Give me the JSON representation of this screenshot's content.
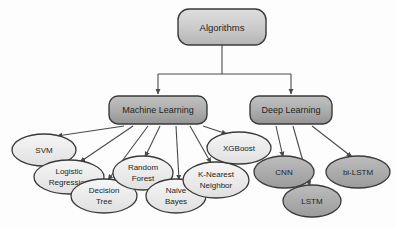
{
  "diagram": {
    "root": {
      "id": "algorithms",
      "label": "Algorithms",
      "shape": "rounded-rect",
      "fill": "#c9c9c9",
      "x": 222,
      "y": 27,
      "w": 88,
      "h": 36
    },
    "branches": [
      {
        "id": "machine-learning",
        "label": "Machine Learning",
        "shape": "rounded-rect",
        "fill": "#a9a9a9",
        "x": 158,
        "y": 110,
        "w": 98,
        "h": 28
      },
      {
        "id": "deep-learning",
        "label": "Deep Learning",
        "shape": "rounded-rect",
        "fill": "#a9a9a9",
        "x": 291,
        "y": 110,
        "w": 82,
        "h": 28
      }
    ],
    "leaves": [
      {
        "id": "svm",
        "parent": "machine-learning",
        "lines": [
          "SVM"
        ],
        "fill": "#ececec",
        "x": 44,
        "y": 150,
        "rx": 32,
        "ry": 16
      },
      {
        "id": "logistic-regression",
        "parent": "machine-learning",
        "lines": [
          "Logistic",
          "Regression"
        ],
        "fill": "#ececec",
        "x": 69,
        "y": 177,
        "rx": 35,
        "ry": 17
      },
      {
        "id": "decision-tree",
        "parent": "machine-learning",
        "lines": [
          "Decision",
          "Tree"
        ],
        "fill": "#ececec",
        "x": 104,
        "y": 196,
        "rx": 33,
        "ry": 17
      },
      {
        "id": "random-forest",
        "parent": "machine-learning",
        "lines": [
          "Random",
          "Forest"
        ],
        "fill": "#ececec",
        "x": 143,
        "y": 173,
        "rx": 30,
        "ry": 17
      },
      {
        "id": "naive-bayes",
        "parent": "machine-learning",
        "lines": [
          "Naive",
          "Bayes"
        ],
        "fill": "#ececec",
        "x": 176,
        "y": 196,
        "rx": 30,
        "ry": 17
      },
      {
        "id": "k-nearest-neighbor",
        "parent": "machine-learning",
        "lines": [
          "K-Nearest",
          "Neighbor"
        ],
        "fill": "#ececec",
        "x": 216,
        "y": 180,
        "rx": 33,
        "ry": 18
      },
      {
        "id": "xgboost",
        "parent": "machine-learning",
        "lines": [
          "XGBoost"
        ],
        "fill": "#ececec",
        "x": 239,
        "y": 148,
        "rx": 32,
        "ry": 16
      },
      {
        "id": "cnn",
        "parent": "deep-learning",
        "lines": [
          "CNN"
        ],
        "fill": "#a9a9a9",
        "x": 284,
        "y": 172,
        "rx": 30,
        "ry": 16
      },
      {
        "id": "lstm",
        "parent": "deep-learning",
        "lines": [
          "LSTM"
        ],
        "fill": "#a9a9a9",
        "x": 312,
        "y": 201,
        "rx": 29,
        "ry": 16
      },
      {
        "id": "bi-lstm",
        "parent": "deep-learning",
        "lines": [
          "bi-LSTM"
        ],
        "fill": "#a9a9a9",
        "x": 358,
        "y": 172,
        "rx": 32,
        "ry": 16
      }
    ],
    "colors": {
      "stroke": "#3a3a3a",
      "edge": "#4a4a4a",
      "text": "#242424",
      "root_fill": "#c9c9c9",
      "branch_fill": "#a9a9a9",
      "leaf_light_fill": "#ececec",
      "leaf_dark_fill": "#a9a9a9",
      "background": "#fdfdfd"
    }
  }
}
